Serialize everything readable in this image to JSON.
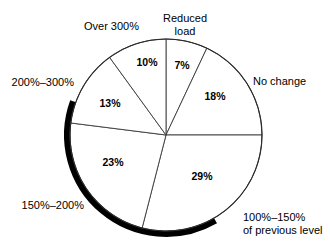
{
  "chart_data": {
    "type": "pie",
    "title": "",
    "subtitle": "",
    "xlabel": "",
    "ylabel": "",
    "legend_position": "none",
    "grid": false,
    "start_angle_deg": 0,
    "direction": "clockwise",
    "categories": [
      "Reduced load",
      "No change",
      "100%–150% of previous level",
      "150%–200%",
      "200%–300%",
      "Over 300%"
    ],
    "values": [
      7,
      18,
      29,
      23,
      13,
      10
    ],
    "value_labels": [
      "7%",
      "18%",
      "29%",
      "23%",
      "13%",
      "10%"
    ],
    "total": 100,
    "units": "percent",
    "slices": [
      {
        "label": "Reduced load",
        "value": 7,
        "value_label": "7%",
        "start_deg": 0,
        "end_deg": 25.2,
        "value_x": 182,
        "value_y": 66,
        "label_lines": [
          "Reduced",
          "load"
        ],
        "label_x": 185,
        "label_y": 13,
        "label_anchor": "middle"
      },
      {
        "label": "No change",
        "value": 18,
        "value_label": "18%",
        "start_deg": 25.2,
        "end_deg": 90,
        "value_x": 215,
        "value_y": 97,
        "label_lines": [
          "No change"
        ],
        "label_x": 253,
        "label_y": 76,
        "label_anchor": "start"
      },
      {
        "label": "100%–150% of previous level",
        "value": 29,
        "value_label": "29%",
        "start_deg": 90,
        "end_deg": 194.4,
        "value_x": 202,
        "value_y": 177,
        "label_lines": [
          "100%–150%",
          "of previous level"
        ],
        "label_x": 243,
        "label_y": 212,
        "label_anchor": "start"
      },
      {
        "label": "150%–200%",
        "value": 23,
        "value_label": "23%",
        "start_deg": 194.4,
        "end_deg": 277.2,
        "value_x": 113,
        "value_y": 163,
        "label_lines": [
          "150%–200%"
        ],
        "label_x": 84,
        "label_y": 200,
        "label_anchor": "end"
      },
      {
        "label": "200%–300%",
        "value": 13,
        "value_label": "13%",
        "start_deg": 277.2,
        "end_deg": 324,
        "value_x": 110,
        "value_y": 104,
        "label_lines": [
          "200%–300%"
        ],
        "label_x": 74,
        "label_y": 77,
        "label_anchor": "end"
      },
      {
        "label": "Over 300%",
        "value": 10,
        "value_label": "10%",
        "start_deg": 324,
        "end_deg": 360,
        "value_x": 147,
        "value_y": 63,
        "label_lines": [
          "Over 300%"
        ],
        "label_x": 139,
        "label_y": 21,
        "label_anchor": "end"
      }
    ],
    "geometry": {
      "center_x": 166,
      "center_y": 135,
      "radius": 96,
      "shadow_start_deg": 150,
      "shadow_end_deg": 290
    },
    "colors": {
      "slice_fill": "#ffffff",
      "slice_stroke": "#3a3a3a",
      "outline": "#2b2b2b",
      "shadow": "#000000",
      "text": "#000000",
      "background": "#ffffff"
    }
  }
}
